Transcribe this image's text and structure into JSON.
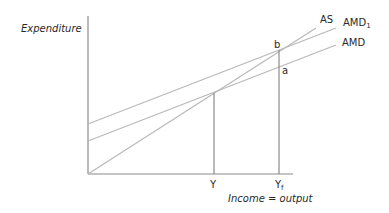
{
  "diagram": {
    "title": "",
    "y_axis_label": "Expenditure",
    "x_axis_label": "Income = output",
    "curves": [
      {
        "name": "AS",
        "label": "AS"
      },
      {
        "name": "AMD1",
        "label": "AMD",
        "subscript": "1"
      },
      {
        "name": "AMD",
        "label": "AMD"
      }
    ],
    "points": [
      {
        "name": "b",
        "label": "b"
      },
      {
        "name": "a",
        "label": "a"
      }
    ],
    "x_ticks": [
      {
        "label": "Y",
        "subscript": ""
      },
      {
        "label": "Y",
        "subscript": "f"
      }
    ],
    "colors": {
      "axis": "#8a8a8a",
      "curve": "#b8b8b8",
      "text": "#2a2a2a"
    }
  }
}
